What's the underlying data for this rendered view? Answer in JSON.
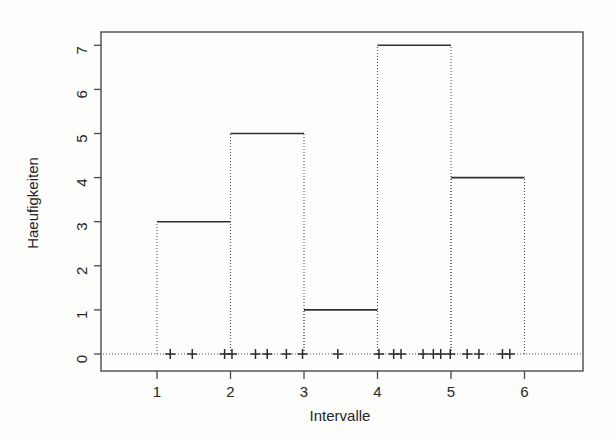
{
  "chart_data": {
    "type": "bar",
    "title": "",
    "subtitle": "",
    "xlabel": "Intervalle",
    "ylabel": "Haeufigkeiten",
    "categories": [
      "1-2",
      "2-3",
      "3-4",
      "4-5",
      "5-6"
    ],
    "bin_edges": [
      1,
      2,
      3,
      4,
      5,
      6
    ],
    "values": [
      3,
      5,
      1,
      7,
      4
    ],
    "xlim": [
      0.4,
      6.6
    ],
    "ylim": [
      0,
      7.4
    ],
    "xticks": [
      1,
      2,
      3,
      4,
      5,
      6
    ],
    "xtick_labels": [
      "1",
      "2",
      "3",
      "4",
      "5",
      "6"
    ],
    "yticks": [
      0,
      1,
      2,
      3,
      4,
      5,
      6,
      7
    ],
    "ytick_labels": [
      "0",
      "1",
      "2",
      "3",
      "4",
      "5",
      "6",
      "7"
    ],
    "grid": false,
    "legend": false,
    "legend_position": "none",
    "bar_style": {
      "fill": "none",
      "top_edge": "solid",
      "side_edge": "dotted",
      "baseline": "dotted"
    },
    "rug": {
      "label": "rug-marks",
      "glyph": "+",
      "count": 20,
      "y": 0,
      "x": [
        1.18,
        1.48,
        1.92,
        2.02,
        2.34,
        2.5,
        2.76,
        2.98,
        3.46,
        4.02,
        4.22,
        4.32,
        4.62,
        4.76,
        4.86,
        4.99,
        5.22,
        5.38,
        5.7,
        5.8
      ]
    },
    "colors": {
      "frame": "#4a4a4a",
      "bar_top": "#303030",
      "bar_side": "#555555",
      "rug": "#2b2b2b",
      "text": "#262626",
      "background": "#fdfdfc"
    }
  },
  "axes": {
    "x_title": "Intervalle",
    "y_title": "Haeufigkeiten"
  }
}
